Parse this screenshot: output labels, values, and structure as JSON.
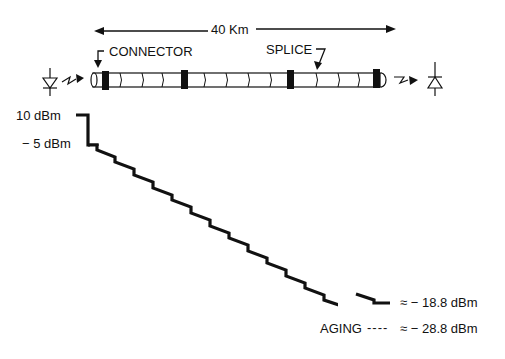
{
  "diagram": {
    "distance_label": "40 Km",
    "connector_label": "CONNECTOR",
    "splice_label": "SPLICE",
    "transmitter_icon": "led-transmitter-icon",
    "receiver_icon": "photodiode-receiver-icon",
    "connectors_count": 4
  },
  "power_levels": {
    "launch": "10 dBm",
    "after_connector": "− 5 dBm",
    "received": "≈ − 18.8 dBm",
    "aging_label": "AGING",
    "aging_dashes": "----",
    "aging_value": "≈ − 28.8 dBm"
  },
  "colors": {
    "line": "#111111",
    "background": "#ffffff"
  }
}
